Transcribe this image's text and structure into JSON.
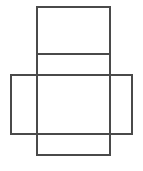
{
  "figure": {
    "kind": "geometric-net",
    "canvas": {
      "width": 143,
      "height": 171,
      "background": "#ffffff"
    },
    "style": {
      "stroke_color": "#4a4a4a",
      "stroke_width": 1.6,
      "fill_color": "#ffffff"
    },
    "faces": [
      {
        "name": "top-flap",
        "x": 37,
        "y": 7,
        "width": 73,
        "height": 47
      },
      {
        "name": "upper-middle",
        "x": 37,
        "y": 54,
        "width": 73,
        "height": 21
      },
      {
        "name": "left-flap",
        "x": 11,
        "y": 75,
        "width": 26,
        "height": 59
      },
      {
        "name": "center-face",
        "x": 37,
        "y": 75,
        "width": 73,
        "height": 59
      },
      {
        "name": "right-flap",
        "x": 110,
        "y": 75,
        "width": 22,
        "height": 59
      },
      {
        "name": "bottom-flap",
        "x": 37,
        "y": 134,
        "width": 73,
        "height": 21
      }
    ],
    "segments": [
      {
        "name": "vertical-left-column",
        "x1": 37,
        "y1": 7,
        "x2": 37,
        "y2": 155
      },
      {
        "name": "vertical-right-column",
        "x1": 110,
        "y1": 7,
        "x2": 110,
        "y2": 155
      },
      {
        "name": "vertical-far-left",
        "x1": 11,
        "y1": 75,
        "x2": 11,
        "y2": 134
      },
      {
        "name": "vertical-far-right",
        "x1": 132,
        "y1": 75,
        "x2": 132,
        "y2": 134
      },
      {
        "name": "horizontal-top",
        "x1": 37,
        "y1": 7,
        "x2": 110,
        "y2": 7
      },
      {
        "name": "horizontal-divider",
        "x1": 37,
        "y1": 54,
        "x2": 110,
        "y2": 54
      },
      {
        "name": "horizontal-band-top",
        "x1": 11,
        "y1": 75,
        "x2": 132,
        "y2": 75
      },
      {
        "name": "horizontal-band-bottom",
        "x1": 11,
        "y1": 134,
        "x2": 132,
        "y2": 134
      },
      {
        "name": "horizontal-bottom",
        "x1": 37,
        "y1": 155,
        "x2": 110,
        "y2": 155
      }
    ]
  }
}
